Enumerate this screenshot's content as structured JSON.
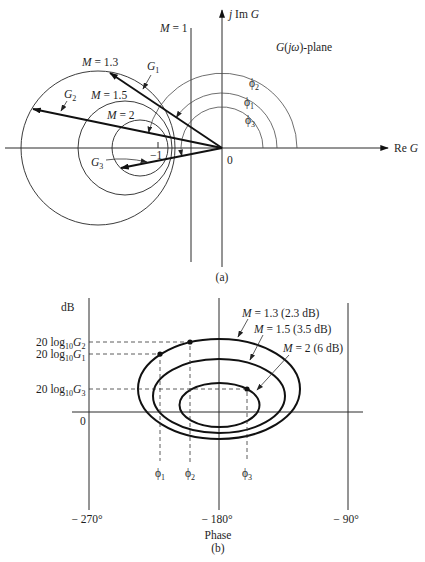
{
  "panel_a": {
    "caption": "(a)",
    "plane_label": {
      "var": "G",
      "open": "(",
      "j": "j",
      "omega": "ω",
      "rest": ")-plane"
    },
    "imag_axis_label": {
      "j": "j",
      "im": " Im ",
      "var": "G"
    },
    "real_axis_label": {
      "re": "Re ",
      "var": "G"
    },
    "origin_label": "0",
    "minus_one_label": "−1",
    "m1_line_label": {
      "var": "M",
      "rest": " = 1"
    },
    "m_circles": [
      {
        "var": "M",
        "rest": " = 1.3"
      },
      {
        "var": "M",
        "rest": " = 1.5"
      },
      {
        "var": "M",
        "rest": " = 2"
      }
    ],
    "vectors": [
      {
        "var": "G",
        "sub": "1"
      },
      {
        "var": "G",
        "sub": "2"
      },
      {
        "var": "G",
        "sub": "3"
      }
    ],
    "phase_arcs": [
      {
        "sym": "ϕ",
        "sub": "1"
      },
      {
        "sym": "ϕ",
        "sub": "2"
      },
      {
        "sym": "ϕ",
        "sub": "3"
      }
    ]
  },
  "panel_b": {
    "caption": "(b)",
    "y_axis_label": "dB",
    "zero_label": "0",
    "y_labels": [
      {
        "coef": "20 log",
        "base": "10",
        "var": "G",
        "sub": "2"
      },
      {
        "coef": "20 log",
        "base": "10",
        "var": "G",
        "sub": "1"
      },
      {
        "coef": "20 log",
        "base": "10",
        "var": "G",
        "sub": "3"
      }
    ],
    "contours": [
      {
        "var": "M",
        "rest": " = 1.3 (2.3 dB)"
      },
      {
        "var": "M",
        "rest": " = 1.5 (3.5 dB)"
      },
      {
        "var": "M",
        "rest": " = 2 (6 dB)"
      }
    ],
    "phase_marks": [
      {
        "sym": "ϕ",
        "sub": "1"
      },
      {
        "sym": "ϕ",
        "sub": "2"
      },
      {
        "sym": "ϕ",
        "sub": "3"
      }
    ],
    "x_ticks": [
      "− 270°",
      "− 180°",
      "− 90°"
    ],
    "x_label": "Phase"
  }
}
